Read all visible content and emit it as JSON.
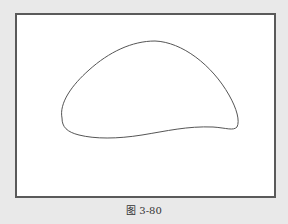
{
  "figure": {
    "caption": "图 3-80",
    "shape": "closed-curve-outline",
    "frame_border_color": "#5a5a5a",
    "background_color": "#e9e9e9",
    "stroke_color": "#555555"
  }
}
